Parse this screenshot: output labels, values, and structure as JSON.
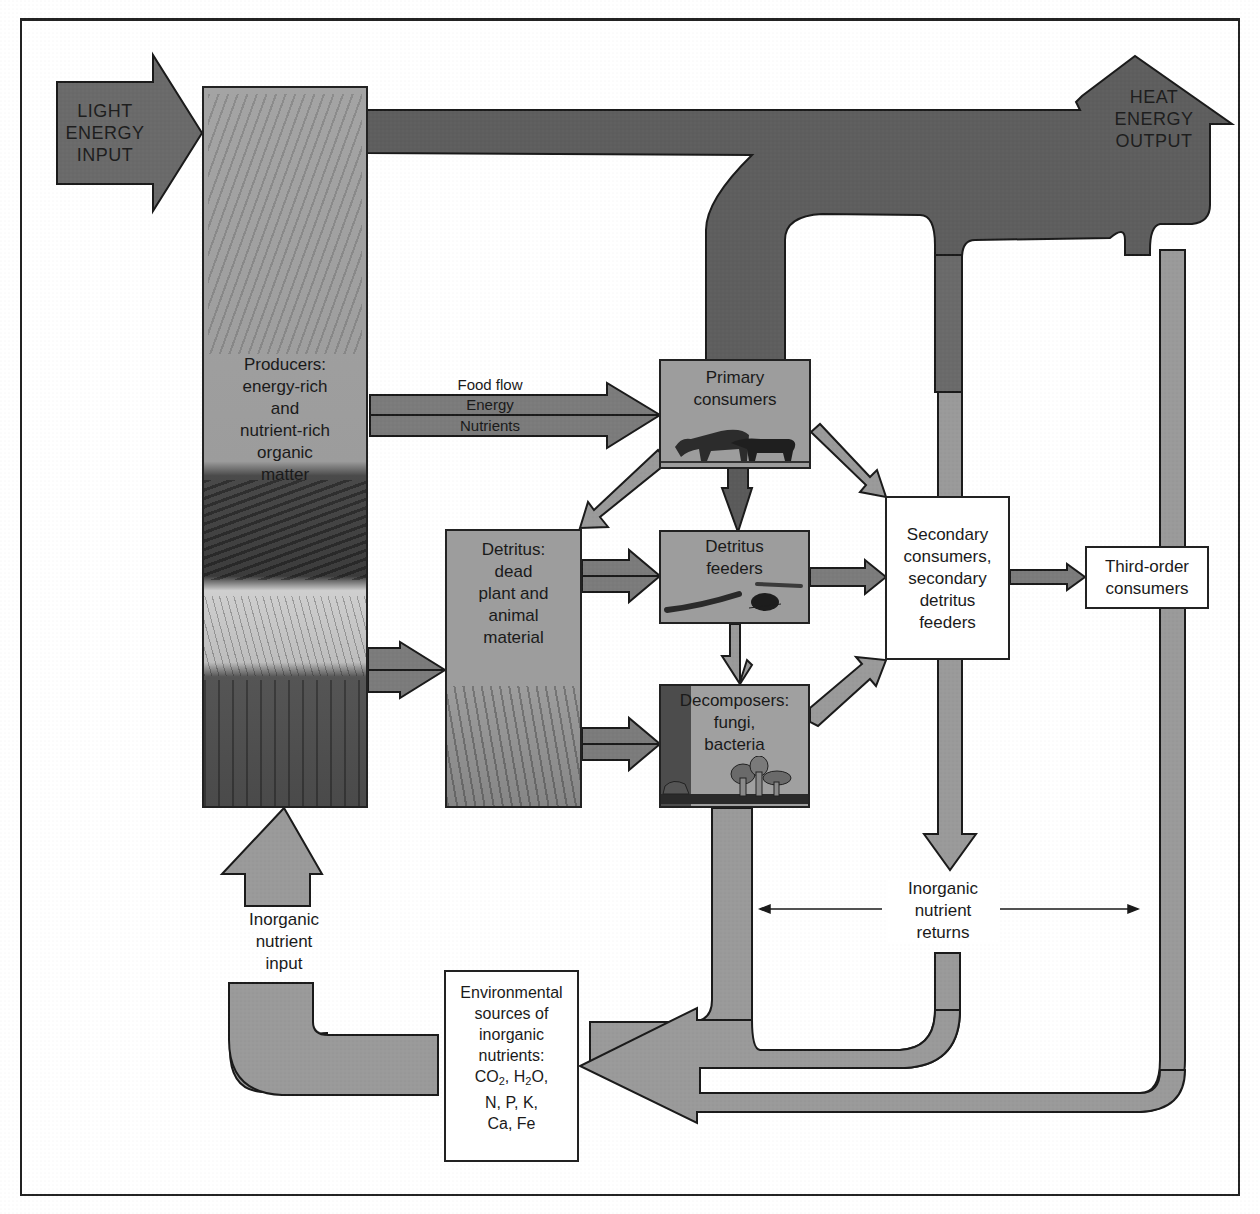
{
  "caption_fragment": "Ecosystems, energy flow, and the biology of organisms (text, cut off at top)",
  "inputs": {
    "light": [
      "LIGHT",
      "ENERGY",
      "INPUT"
    ],
    "heat": [
      "HEAT",
      "ENERGY",
      "OUTPUT"
    ]
  },
  "producers": {
    "lines": [
      "Producers:",
      "energy-rich",
      "and",
      "nutrient-rich",
      "organic",
      "matter"
    ]
  },
  "food_flow": {
    "title": "Food flow",
    "energy": "Energy",
    "nutrients": "Nutrients"
  },
  "primary_consumers": {
    "lines": [
      "Primary",
      "consumers"
    ]
  },
  "detritus": {
    "lines": [
      "Detritus:",
      "dead",
      "plant and",
      "animal",
      "material"
    ]
  },
  "detritus_feeders": {
    "lines": [
      "Detritus",
      "feeders"
    ]
  },
  "decomposers": {
    "lines": [
      "Decomposers:",
      "fungi,",
      "bacteria"
    ]
  },
  "secondary_consumers": {
    "lines": [
      "Secondary",
      "consumers,",
      "secondary",
      "detritus",
      "feeders"
    ]
  },
  "third_order": {
    "lines": [
      "Third-order",
      "consumers"
    ]
  },
  "inorganic_returns": {
    "lines": [
      "Inorganic",
      "nutrient",
      "returns"
    ]
  },
  "inorganic_input": {
    "lines": [
      "Inorganic",
      "nutrient",
      "input"
    ]
  },
  "environmental_sources": {
    "lines": [
      "Environmental",
      "sources of",
      "inorganic",
      "nutrients:"
    ],
    "formula_1": {
      "co": "CO",
      "co_sub": "2",
      "sep": ", ",
      "h": "H",
      "h_sub": "2",
      "o": "O,"
    },
    "formula_2": "N, P, K,",
    "formula_3": "Ca, Fe"
  },
  "colors": {
    "heat_pipe": "#5e5e5e",
    "nutrient_pipe": "#9a9a9a",
    "box_gray": "#9d9d9d",
    "outline": "#1a1a1a"
  }
}
